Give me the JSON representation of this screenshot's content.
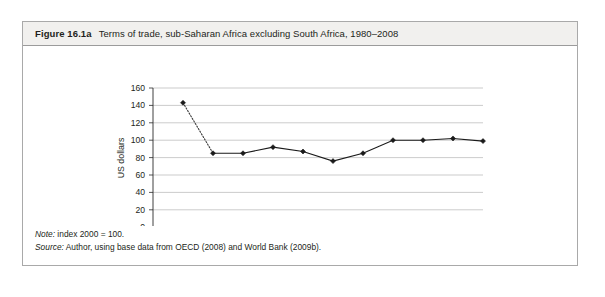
{
  "figure": {
    "label": "Figure 16.1a",
    "caption": "Terms of trade, sub-Saharan Africa excluding South Africa, 1980–2008"
  },
  "notes": {
    "note_label": "Note:",
    "note_text": " index 2000 = 100.",
    "source_label": "Source:",
    "source_text": " Author, using base data from OECD (2008) and World Bank (2009b)."
  },
  "chart_data": {
    "type": "line",
    "title": "Terms of trade, sub-Saharan Africa excluding South Africa, 1980–2008",
    "xlabel": "",
    "ylabel": "US dollars",
    "categories": [
      "1980",
      "1994",
      "1995",
      "1996",
      "1997",
      "1998",
      "1999",
      "2000",
      "2003",
      "2005",
      "2008"
    ],
    "values": [
      143,
      85,
      85,
      92,
      87,
      76,
      85,
      100,
      100,
      102,
      99
    ],
    "ylim": [
      0,
      160
    ],
    "yticks": [
      0,
      20,
      40,
      60,
      80,
      100,
      120,
      140,
      160
    ],
    "grid": true,
    "legend": "none",
    "series_style": {
      "gap_segment": "dotted between 1980 and 1994",
      "line_color": "#1a1a1a",
      "marker": "filled-diamond"
    },
    "annotations": [
      "index 2000 = 100"
    ]
  },
  "colors": {
    "border": "#a9a9a9",
    "header_background": "#f1f0ee",
    "gridline": "#b6b6b6",
    "line": "#1a1a1a",
    "text": "#231f20"
  }
}
